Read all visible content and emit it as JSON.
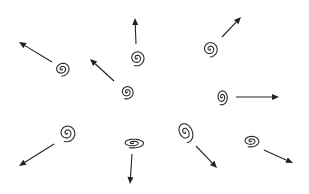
{
  "diagram": {
    "colors": {
      "stroke": "#2a2a2a",
      "background": "#ffffff"
    },
    "elements": [
      {
        "id": "spiral-1",
        "cx": 62,
        "cy": 69,
        "rx": 8,
        "ry": 7,
        "rot": -20,
        "arrow": {
          "x1": 52,
          "y1": 62,
          "x2": 19,
          "y2": 42
        }
      },
      {
        "id": "spiral-2",
        "cx": 137,
        "cy": 58,
        "rx": 8,
        "ry": 8,
        "rot": 0,
        "arrow": {
          "x1": 136,
          "y1": 44,
          "x2": 135,
          "y2": 18
        }
      },
      {
        "id": "spiral-3",
        "cx": 127,
        "cy": 92,
        "rx": 7,
        "ry": 7,
        "rot": 0,
        "arrow": {
          "x1": 114,
          "y1": 81,
          "x2": 90,
          "y2": 59
        }
      },
      {
        "id": "spiral-4",
        "cx": 210,
        "cy": 49,
        "rx": 8,
        "ry": 8,
        "rot": -20,
        "arrow": {
          "x1": 222,
          "y1": 37,
          "x2": 241,
          "y2": 17
        }
      },
      {
        "id": "spiral-5",
        "cx": 222,
        "cy": 97,
        "rx": 6,
        "ry": 8,
        "rot": 0,
        "arrow": {
          "x1": 236,
          "y1": 97,
          "x2": 279,
          "y2": 97
        }
      },
      {
        "id": "spiral-6",
        "cx": 67,
        "cy": 133,
        "rx": 9,
        "ry": 9,
        "rot": 0,
        "arrow": {
          "x1": 54,
          "y1": 144,
          "x2": 19,
          "y2": 166
        }
      },
      {
        "id": "spiral-7",
        "cx": 133,
        "cy": 143,
        "rx": 12,
        "ry": 5,
        "rot": 0,
        "arrow": {
          "x1": 132,
          "y1": 154,
          "x2": 130,
          "y2": 184
        }
      },
      {
        "id": "spiral-8",
        "cx": 185,
        "cy": 132,
        "rx": 8,
        "ry": 11,
        "rot": -25,
        "arrow": {
          "x1": 196,
          "y1": 146,
          "x2": 217,
          "y2": 168
        }
      },
      {
        "id": "spiral-9",
        "cx": 251,
        "cy": 141,
        "rx": 9,
        "ry": 6,
        "rot": 0,
        "arrow": {
          "x1": 264,
          "y1": 150,
          "x2": 293,
          "y2": 163
        }
      }
    ]
  }
}
